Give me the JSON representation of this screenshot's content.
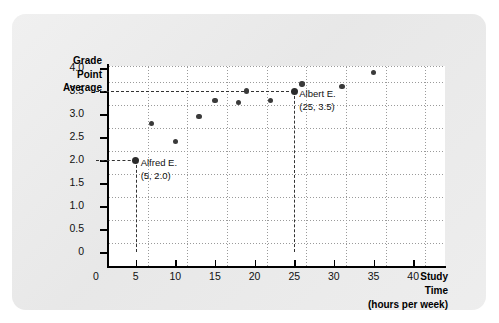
{
  "chart_data": {
    "type": "scatter",
    "title": "",
    "xlabel": "Study Time (hours per week)",
    "ylabel": "Grade Point Average",
    "xlabel_lines": [
      "Study",
      "Time",
      "(hours per week)"
    ],
    "ylabel_lines": [
      "Grade",
      "Point",
      "Average"
    ],
    "xlim": [
      0,
      42.5
    ],
    "ylim": [
      0,
      4.35
    ],
    "grid": true,
    "legend": "none",
    "x_ticks": [
      0,
      5,
      10,
      15,
      20,
      25,
      30,
      35,
      40
    ],
    "x_tick_labels": [
      "0",
      "5",
      "10",
      "15",
      "20",
      "25",
      "30",
      "35",
      "40"
    ],
    "y_ticks": [
      0,
      0.5,
      1.0,
      1.5,
      2.0,
      2.5,
      3.0,
      3.5,
      4.0
    ],
    "y_tick_labels": [
      "0",
      "0.5",
      "1.0",
      "1.5",
      "2.0",
      "2.5",
      "3.0",
      "3.5",
      "4.0"
    ],
    "points": [
      {
        "x": 5,
        "y": 2.0,
        "highlight": true
      },
      {
        "x": 7,
        "y": 2.8,
        "highlight": false
      },
      {
        "x": 10,
        "y": 2.4,
        "highlight": false
      },
      {
        "x": 13,
        "y": 2.95,
        "highlight": false
      },
      {
        "x": 15,
        "y": 3.3,
        "highlight": false
      },
      {
        "x": 18,
        "y": 3.25,
        "highlight": false
      },
      {
        "x": 19,
        "y": 3.5,
        "highlight": false
      },
      {
        "x": 22,
        "y": 3.3,
        "highlight": false
      },
      {
        "x": 25,
        "y": 3.5,
        "highlight": true
      },
      {
        "x": 26,
        "y": 3.65,
        "highlight": false
      },
      {
        "x": 31,
        "y": 3.6,
        "highlight": false
      },
      {
        "x": 35,
        "y": 3.9,
        "highlight": false
      }
    ],
    "annotations": [
      {
        "name": "alfred",
        "label": "Alfred E.",
        "coords": "(5, 2.0)",
        "x": 5,
        "y": 2.0
      },
      {
        "name": "albert",
        "label": "Albert E.",
        "coords": "(25, 3.5)",
        "x": 25,
        "y": 3.5
      }
    ],
    "colors": {
      "point": "#3a3a3a",
      "axis": "#000000",
      "grid": "#9a9a9a",
      "card_background": "#e8e8e8",
      "plot_background": "#ffffff",
      "leader_line": "#333333"
    }
  }
}
